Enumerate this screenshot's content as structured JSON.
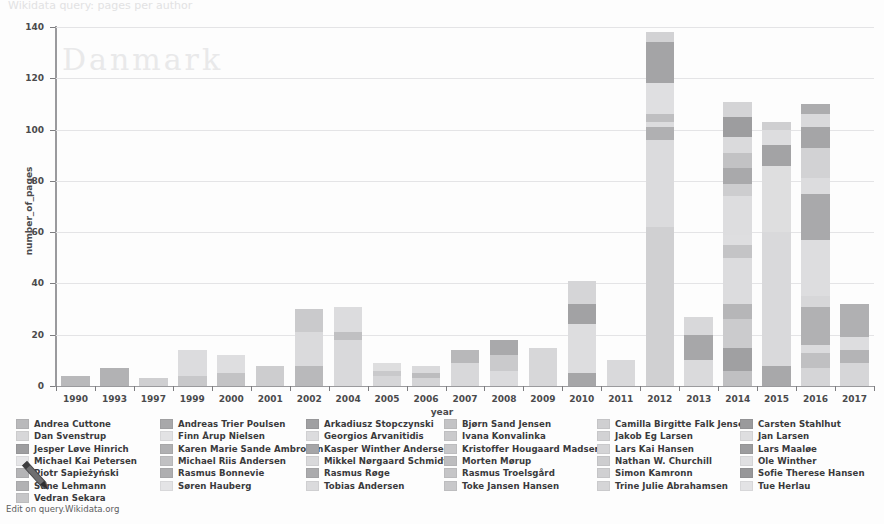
{
  "page": {
    "faint_header": "Wikidata query: pages per author",
    "footer_link": "Edit on query.Wikidata.org"
  },
  "chart_data": {
    "type": "bar",
    "stacked": true,
    "title": "",
    "xlabel": "year",
    "ylabel": "number_of_pages",
    "ylim": [
      0,
      140
    ],
    "yticks": [
      0,
      20,
      40,
      60,
      80,
      100,
      120,
      140
    ],
    "grid": true,
    "legend_position": "bottom",
    "categories": [
      "1990",
      "1993",
      "1997",
      "1999",
      "2000",
      "2001",
      "2002",
      "2004",
      "2005",
      "2006",
      "2007",
      "2008",
      "2009",
      "2010",
      "2011",
      "2012",
      "2013",
      "2014",
      "2015",
      "2016",
      "2017"
    ],
    "totals": [
      4,
      7,
      3,
      14,
      12,
      8,
      30,
      31,
      9,
      8,
      14,
      18,
      15,
      41,
      10,
      138,
      27,
      111,
      103,
      110,
      32
    ],
    "series": [
      {
        "name": "Andrea Cuttone",
        "color": "#b9b9bb"
      },
      {
        "name": "Andreas Trier Poulsen",
        "color": "#a8a8aa"
      },
      {
        "name": "Arkadiusz Stopczynski",
        "color": "#a0a0a2"
      },
      {
        "name": "Bjørn Sand Jensen",
        "color": "#c3c3c5"
      },
      {
        "name": "Camilla Birgitte Falk Jensen",
        "color": "#cfcfd1"
      },
      {
        "name": "Carsten Stahlhut",
        "color": "#9a9a9c"
      },
      {
        "name": "Dan Svenstrup",
        "color": "#d7d7d9"
      },
      {
        "name": "Finn Årup Nielsen",
        "color": "#e2e2e4"
      },
      {
        "name": "Georgios Arvanitidis",
        "color": "#dcdcde"
      },
      {
        "name": "Ivana Konvalinka",
        "color": "#cacacc"
      },
      {
        "name": "Jakob Eg Larsen",
        "color": "#d2d2d4"
      },
      {
        "name": "Jan Larsen",
        "color": "#dedee0"
      },
      {
        "name": "Jesper Løve Hinrich",
        "color": "#9e9ea0"
      },
      {
        "name": "Karen Marie Sande Ambrosen",
        "color": "#b0b0b2"
      },
      {
        "name": "Kasper Winther Andersen",
        "color": "#a5a5a7"
      },
      {
        "name": "Kristoffer Hougaard Madsen",
        "color": "#c7c7c9"
      },
      {
        "name": "Lars Kai Hansen",
        "color": "#d4d4d6"
      },
      {
        "name": "Lars Maaløe",
        "color": "#9c9c9e"
      },
      {
        "name": "Michael Kai Petersen",
        "color": "#e6e6e8"
      },
      {
        "name": "Michael Riis Andersen",
        "color": "#c1c1c3"
      },
      {
        "name": "Mikkel Nørgaard Schmidt",
        "color": "#d9d9db"
      },
      {
        "name": "Morten Mørup",
        "color": "#bdbdbf"
      },
      {
        "name": "Nathan W. Churchill",
        "color": "#cdcdcf"
      },
      {
        "name": "Ole Winther",
        "color": "#e0e0e2"
      },
      {
        "name": "Piotr Sapieżyński",
        "color": "#b4b4b6"
      },
      {
        "name": "Rasmus Bonnevie",
        "color": "#aeaeb0"
      },
      {
        "name": "Rasmus Røge",
        "color": "#ababad"
      },
      {
        "name": "Rasmus Troelsgård",
        "color": "#c5c5c7"
      },
      {
        "name": "Simon Kamronn",
        "color": "#d0d0d2"
      },
      {
        "name": "Sofie Therese Hansen",
        "color": "#979799"
      },
      {
        "name": "Sune Lehmann",
        "color": "#b2b2b4"
      },
      {
        "name": "Søren Hauberg",
        "color": "#e4e4e6"
      },
      {
        "name": "Tobias Andersen",
        "color": "#dbdbdd"
      },
      {
        "name": "Toke Jansen Hansen",
        "color": "#c8c8ca"
      },
      {
        "name": "Trine Julie Abrahamsen",
        "color": "#d5d5d7"
      },
      {
        "name": "Tue Herlau",
        "color": "#e3e3e5"
      }
    ],
    "bars": [
      {
        "year": "1990",
        "total": 4,
        "segments": [
          {
            "c": "#b9b9bb",
            "v": 4
          }
        ]
      },
      {
        "year": "1993",
        "total": 7,
        "segments": [
          {
            "c": "#b2b2b4",
            "v": 7
          }
        ]
      },
      {
        "year": "1997",
        "total": 3,
        "segments": [
          {
            "c": "#cfcfd1",
            "v": 3
          }
        ]
      },
      {
        "year": "1999",
        "total": 14,
        "segments": [
          {
            "c": "#c8c8ca",
            "v": 4
          },
          {
            "c": "#dcdcde",
            "v": 10
          }
        ]
      },
      {
        "year": "2000",
        "total": 12,
        "segments": [
          {
            "c": "#c3c3c5",
            "v": 5
          },
          {
            "c": "#dedee0",
            "v": 7
          }
        ]
      },
      {
        "year": "2001",
        "total": 8,
        "segments": [
          {
            "c": "#cdcdcf",
            "v": 8
          }
        ]
      },
      {
        "year": "2002",
        "total": 30,
        "segments": [
          {
            "c": "#b9b9bb",
            "v": 8
          },
          {
            "c": "#dadadc",
            "v": 13
          },
          {
            "c": "#cacacc",
            "v": 9
          }
        ]
      },
      {
        "year": "2004",
        "total": 31,
        "segments": [
          {
            "c": "#d9d9db",
            "v": 18
          },
          {
            "c": "#c0c0c2",
            "v": 3
          },
          {
            "c": "#dcdcde",
            "v": 10
          }
        ]
      },
      {
        "year": "2005",
        "total": 9,
        "segments": [
          {
            "c": "#d6d6d8",
            "v": 4
          },
          {
            "c": "#c9c9cb",
            "v": 2
          },
          {
            "c": "#dededf",
            "v": 3
          }
        ]
      },
      {
        "year": "2006",
        "total": 8,
        "segments": [
          {
            "c": "#d4d4d6",
            "v": 3
          },
          {
            "c": "#bcbcbe",
            "v": 2
          },
          {
            "c": "#dadadc",
            "v": 3
          }
        ]
      },
      {
        "year": "2007",
        "total": 14,
        "segments": [
          {
            "c": "#d8d8da",
            "v": 9
          },
          {
            "c": "#b8b8ba",
            "v": 5
          }
        ]
      },
      {
        "year": "2008",
        "total": 18,
        "segments": [
          {
            "c": "#dbdbdd",
            "v": 6
          },
          {
            "c": "#cacacc",
            "v": 6
          },
          {
            "c": "#a9a9ab",
            "v": 6
          }
        ]
      },
      {
        "year": "2009",
        "total": 15,
        "segments": [
          {
            "c": "#d7d7d9",
            "v": 15
          }
        ]
      },
      {
        "year": "2010",
        "total": 41,
        "segments": [
          {
            "c": "#a6a6a8",
            "v": 5
          },
          {
            "c": "#dddddf",
            "v": 19
          },
          {
            "c": "#a2a2a4",
            "v": 8
          },
          {
            "c": "#d5d5d7",
            "v": 9
          }
        ]
      },
      {
        "year": "2011",
        "total": 10,
        "segments": [
          {
            "c": "#d9d9db",
            "v": 10
          }
        ]
      },
      {
        "year": "2012",
        "total": 138,
        "segments": [
          {
            "c": "#d0d0d2",
            "v": 62
          },
          {
            "c": "#dbdbdd",
            "v": 34
          },
          {
            "c": "#b0b0b2",
            "v": 5
          },
          {
            "c": "#dcdcde",
            "v": 2
          },
          {
            "c": "#bfbfc1",
            "v": 3
          },
          {
            "c": "#dfdfe1",
            "v": 12
          },
          {
            "c": "#a4a4a6",
            "v": 16
          },
          {
            "c": "#d2d2d4",
            "v": 4
          }
        ]
      },
      {
        "year": "2013",
        "total": 27,
        "segments": [
          {
            "c": "#dadadc",
            "v": 10
          },
          {
            "c": "#a7a7a9",
            "v": 10
          },
          {
            "c": "#d8d8da",
            "v": 7
          }
        ]
      },
      {
        "year": "2014",
        "total": 111,
        "segments": [
          {
            "c": "#c0c0c2",
            "v": 6
          },
          {
            "c": "#a0a0a2",
            "v": 9
          },
          {
            "c": "#cbcbcd",
            "v": 11
          },
          {
            "c": "#b6b6b8",
            "v": 6
          },
          {
            "c": "#dcdcde",
            "v": 18
          },
          {
            "c": "#c4c4c6",
            "v": 5
          },
          {
            "c": "#dedee0",
            "v": 4
          },
          {
            "c": "#dddddf",
            "v": 15
          },
          {
            "c": "#cdcdcf",
            "v": 5
          },
          {
            "c": "#a9a9ab",
            "v": 6
          },
          {
            "c": "#c2c2c4",
            "v": 6
          },
          {
            "c": "#dadadc",
            "v": 6
          },
          {
            "c": "#9d9d9f",
            "v": 8
          },
          {
            "c": "#d4d4d6",
            "v": 6
          }
        ]
      },
      {
        "year": "2015",
        "total": 103,
        "segments": [
          {
            "c": "#a8a8aa",
            "v": 8
          },
          {
            "c": "#d9d9db",
            "v": 52
          },
          {
            "c": "#dededf",
            "v": 26
          },
          {
            "c": "#a3a3a5",
            "v": 8
          },
          {
            "c": "#dddddf",
            "v": 6
          },
          {
            "c": "#cfcfd1",
            "v": 3
          }
        ]
      },
      {
        "year": "2016",
        "total": 110,
        "segments": [
          {
            "c": "#d5d5d7",
            "v": 7
          },
          {
            "c": "#c0c0c2",
            "v": 6
          },
          {
            "c": "#dbdbdd",
            "v": 3
          },
          {
            "c": "#b1b1b3",
            "v": 15
          },
          {
            "c": "#d7d7d9",
            "v": 4
          },
          {
            "c": "#dddddf",
            "v": 22
          },
          {
            "c": "#a9a9ab",
            "v": 18
          },
          {
            "c": "#dcdcde",
            "v": 6
          },
          {
            "c": "#d2d2d4",
            "v": 12
          },
          {
            "c": "#a5a5a7",
            "v": 8
          },
          {
            "c": "#d9d9db",
            "v": 5
          },
          {
            "c": "#acacae",
            "v": 4
          }
        ]
      },
      {
        "year": "2017",
        "total": 32,
        "segments": [
          {
            "c": "#d6d6d8",
            "v": 9
          },
          {
            "c": "#b4b4b6",
            "v": 5
          },
          {
            "c": "#dddddf",
            "v": 5
          },
          {
            "c": "#b0b0b2",
            "v": 13
          }
        ]
      }
    ]
  },
  "legend": {
    "columns": [
      {
        "items": [
          {
            "label": "Andrea Cuttone",
            "color": "#b9b9bb"
          },
          {
            "label": "Dan Svenstrup",
            "color": "#d7d7d9"
          },
          {
            "label": "Jesper Løve Hinrich",
            "color": "#9e9ea0"
          },
          {
            "label": "Michael Kai Petersen",
            "color": "#e6e6e8"
          },
          {
            "label": "Piotr Sapieżyński",
            "color": "#b4b4b6"
          },
          {
            "label": "Sune Lehmann",
            "color": "#b2b2b4"
          },
          {
            "label": "Vedran Sekara",
            "color": "#c6c6c8"
          }
        ]
      },
      {
        "items": [
          {
            "label": "Andreas Trier Poulsen",
            "color": "#a8a8aa"
          },
          {
            "label": "Finn Årup Nielsen",
            "color": "#e2e2e4"
          },
          {
            "label": "Karen Marie Sande Ambrosen",
            "color": "#b0b0b2"
          },
          {
            "label": "Michael Riis Andersen",
            "color": "#c1c1c3"
          },
          {
            "label": "Rasmus Bonnevie",
            "color": "#aeaeb0"
          },
          {
            "label": "Søren Hauberg",
            "color": "#e4e4e6"
          }
        ]
      },
      {
        "items": [
          {
            "label": "Arkadiusz Stopczynski",
            "color": "#a0a0a2"
          },
          {
            "label": "Georgios Arvanitidis",
            "color": "#dcdcde"
          },
          {
            "label": "Kasper Winther Andersen",
            "color": "#a5a5a7"
          },
          {
            "label": "Mikkel Nørgaard Schmidt",
            "color": "#d9d9db"
          },
          {
            "label": "Rasmus Røge",
            "color": "#ababad"
          },
          {
            "label": "Tobias Andersen",
            "color": "#dbdbdd"
          }
        ]
      },
      {
        "items": [
          {
            "label": "Bjørn Sand Jensen",
            "color": "#c3c3c5"
          },
          {
            "label": "Ivana Konvalinka",
            "color": "#cacacc"
          },
          {
            "label": "Kristoffer Hougaard Madsen",
            "color": "#c7c7c9"
          },
          {
            "label": "Morten Mørup",
            "color": "#bdbdbf"
          },
          {
            "label": "Rasmus Troelsgård",
            "color": "#c5c5c7"
          },
          {
            "label": "Toke Jansen Hansen",
            "color": "#c8c8ca"
          }
        ]
      },
      {
        "items": [
          {
            "label": "Camilla Birgitte Falk Jensen",
            "color": "#cfcfd1"
          },
          {
            "label": "Jakob Eg Larsen",
            "color": "#d2d2d4"
          },
          {
            "label": "Lars Kai Hansen",
            "color": "#d4d4d6"
          },
          {
            "label": "Nathan W. Churchill",
            "color": "#cdcdcf"
          },
          {
            "label": "Simon Kamronn",
            "color": "#d0d0d2"
          },
          {
            "label": "Trine Julie Abrahamsen",
            "color": "#d5d5d7"
          }
        ]
      },
      {
        "items": [
          {
            "label": "Carsten Stahlhut",
            "color": "#9a9a9c"
          },
          {
            "label": "Jan Larsen",
            "color": "#dedee0"
          },
          {
            "label": "Lars Maaløe",
            "color": "#9c9c9e"
          },
          {
            "label": "Ole Winther",
            "color": "#e0e0e2"
          },
          {
            "label": "Sofie Therese Hansen",
            "color": "#979799"
          },
          {
            "label": "Tue Herlau",
            "color": "#e3e3e5"
          }
        ]
      }
    ]
  }
}
